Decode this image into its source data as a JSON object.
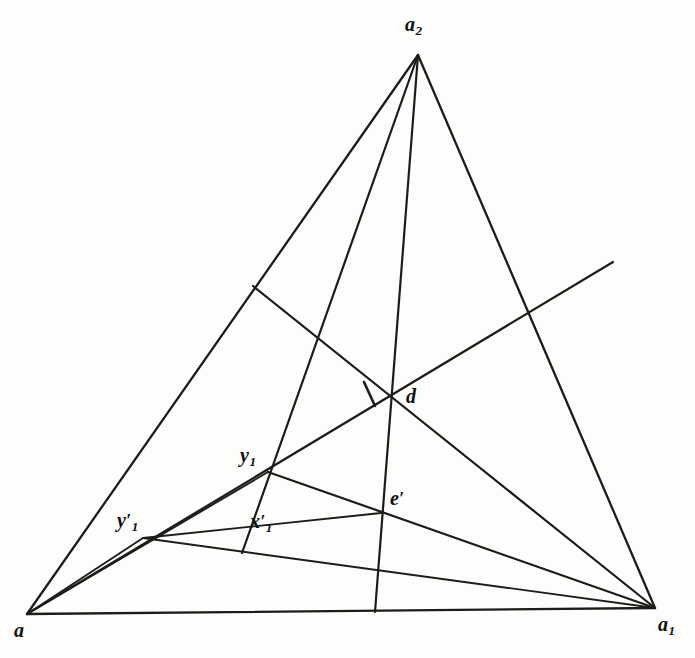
{
  "figure": {
    "background_color": "#fdfdfb",
    "stroke_color": "#1d1c1a",
    "width": 695,
    "height": 658
  },
  "points": {
    "a": {
      "label": "a",
      "sub": "",
      "prime": "",
      "x": 27,
      "y": 614
    },
    "a1": {
      "label": "a",
      "sub": "1",
      "prime": "",
      "x": 655,
      "y": 608
    },
    "a2": {
      "label": "a",
      "sub": "2",
      "prime": "",
      "x": 418,
      "y": 55
    },
    "d": {
      "label": "d",
      "sub": "",
      "prime": "",
      "x": 390,
      "y": 395
    },
    "y1": {
      "label": "y",
      "sub": "1",
      "prime": "",
      "x": 268,
      "y": 472
    },
    "e1": {
      "label": "e",
      "sub": "",
      "prime": "′",
      "x": 381,
      "y": 513
    },
    "y1p": {
      "label": "y",
      "sub": "1",
      "prime": "′",
      "x": 143,
      "y": 538
    },
    "x1p": {
      "label": "x",
      "sub": "1",
      "prime": "′",
      "x": 242,
      "y": 553
    },
    "p_left_edge": {
      "label": "",
      "sub": "",
      "prime": "",
      "x": 253,
      "y": 286
    },
    "p_right_edge": {
      "label": "",
      "sub": "",
      "prime": "",
      "x": 532,
      "y": 310
    },
    "p_diag_end": {
      "label": "",
      "sub": "",
      "prime": "",
      "x": 613,
      "y": 262
    },
    "p_base_foot": {
      "label": "",
      "sub": "",
      "prime": "",
      "x": 375,
      "y": 612
    }
  },
  "labels": [
    {
      "name": "vertex-label-a",
      "text": "a",
      "sub": "",
      "prime": ""
    },
    {
      "name": "vertex-label-a1",
      "text": "a",
      "sub": "1",
      "prime": ""
    },
    {
      "name": "vertex-label-a2",
      "text": "a",
      "sub": "2",
      "prime": ""
    },
    {
      "name": "vertex-label-d",
      "text": "d",
      "sub": "",
      "prime": ""
    },
    {
      "name": "vertex-label-y1",
      "text": "y",
      "sub": "1",
      "prime": ""
    },
    {
      "name": "vertex-label-e1",
      "text": "e",
      "sub": "",
      "prime": "′"
    },
    {
      "name": "vertex-label-y1-prime",
      "text": "y",
      "sub": "1",
      "prime": "′"
    },
    {
      "name": "vertex-label-x1-prime",
      "text": "x",
      "sub": "1",
      "prime": "′"
    }
  ],
  "segments": [
    {
      "name": "edge-a-a2",
      "kind": "tri-edge",
      "from": [
        27,
        614
      ],
      "to": [
        418,
        55
      ]
    },
    {
      "name": "edge-a2-a1",
      "kind": "tri-edge",
      "from": [
        418,
        55
      ],
      "to": [
        655,
        608
      ]
    },
    {
      "name": "edge-a-a1-base",
      "kind": "tri-edge",
      "from": [
        27,
        614
      ],
      "to": [
        655,
        608
      ]
    },
    {
      "name": "cevian-a2-base",
      "kind": "cevian",
      "from": [
        418,
        55
      ],
      "to": [
        375,
        612
      ]
    },
    {
      "name": "cevian-a2-x1p",
      "kind": "cevian",
      "from": [
        418,
        55
      ],
      "to": [
        242,
        553
      ]
    },
    {
      "name": "diagonal-a-extended",
      "kind": "inner",
      "from": [
        27,
        614
      ],
      "to": [
        613,
        262
      ]
    },
    {
      "name": "segment-leftedge-d-a1",
      "kind": "inner",
      "from": [
        253,
        286
      ],
      "to": [
        655,
        608
      ]
    },
    {
      "name": "segment-y1-a1",
      "kind": "inner",
      "from": [
        268,
        472
      ],
      "to": [
        655,
        608
      ]
    },
    {
      "name": "segment-a-y1",
      "kind": "thin",
      "from": [
        27,
        614
      ],
      "to": [
        268,
        472
      ]
    },
    {
      "name": "segment-y1p-e1",
      "kind": "thin",
      "from": [
        143,
        538
      ],
      "to": [
        381,
        513
      ]
    },
    {
      "name": "segment-a-y1p",
      "kind": "thin",
      "from": [
        27,
        614
      ],
      "to": [
        143,
        538
      ]
    },
    {
      "name": "segment-y1p-a1",
      "kind": "thin",
      "from": [
        143,
        538
      ],
      "to": [
        655,
        608
      ]
    },
    {
      "name": "tick-mark-at-d",
      "kind": "tick",
      "from": [
        364,
        382
      ],
      "to": [
        375,
        406
      ]
    }
  ]
}
